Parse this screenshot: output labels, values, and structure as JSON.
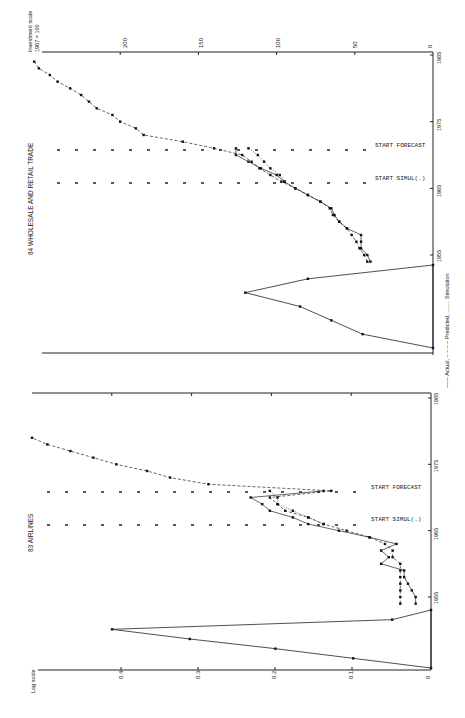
{
  "figure": {
    "orientation": "rotated 90 degrees counter-clockwise",
    "legend": "—— Actual, – – – – Predicted, ........ Simulation",
    "legend_items": [
      {
        "label": "Actual",
        "style": "solid"
      },
      {
        "label": "Predicted",
        "style": "dashed"
      },
      {
        "label": "Simulation",
        "style": "dotted"
      }
    ]
  },
  "panels": {
    "top": {
      "title": "84 WHOLESALE AND RETAIL TRADE",
      "yaxis_label_line1": "Investment scale",
      "yaxis_label_line2": "1967 = 100",
      "ytick_labels": [
        "200",
        "150",
        "100",
        "50",
        "0"
      ],
      "year_labels": [
        "1985",
        "1975",
        "1965",
        "1955"
      ],
      "marker_forecast": "START FORECAST",
      "marker_simul": "START SIMUL(.)"
    },
    "bottom": {
      "title": "83 AIRLINES",
      "lag_axis_label": "Lag scale",
      "lag_tick_labels": [
        "0.4",
        "0.3",
        "0.2",
        "0.1",
        "0"
      ],
      "year_labels": [
        "1985",
        "1975",
        "1965",
        "1955"
      ],
      "marker_forecast": "START FORECAST",
      "marker_simul": "START SIMUL(.)"
    }
  },
  "chart_data": [
    {
      "type": "line",
      "title": "84 WHOLESALE AND RETAIL TRADE",
      "xlabel": "Year",
      "ylabel": "Investment scale 1967 = 100",
      "xlim": [
        1953,
        1985
      ],
      "ylim": [
        0,
        250
      ],
      "x_ticks": [
        1955,
        1965,
        1975,
        1985
      ],
      "y_ticks": [
        0,
        50,
        100,
        150,
        200
      ],
      "annotations": [
        {
          "text": "START SIMUL(.)",
          "x": 1966
        },
        {
          "text": "START FORECAST",
          "x": 1971
        }
      ],
      "series": [
        {
          "name": "Actual",
          "style": "solid",
          "x": [
            1954,
            1955,
            1956,
            1957,
            1958,
            1959,
            1960,
            1961,
            1962,
            1963,
            1964,
            1965,
            1966,
            1967,
            1968,
            1969,
            1970,
            1971
          ],
          "values": [
            40,
            42,
            46,
            46,
            46,
            55,
            60,
            63,
            65,
            72,
            80,
            88,
            95,
            100,
            110,
            118,
            126,
            126
          ]
        },
        {
          "name": "Predicted",
          "style": "dashed",
          "x": [
            1954,
            1955,
            1956,
            1957,
            1958,
            1959,
            1960,
            1961,
            1962,
            1963,
            1964,
            1965,
            1966,
            1967,
            1968,
            1969,
            1970,
            1971,
            1972,
            1973,
            1974,
            1975,
            1976,
            1977,
            1978,
            1979,
            1980,
            1981,
            1982,
            1983,
            1984
          ],
          "values": [
            42,
            44,
            47,
            49,
            52,
            55,
            60,
            64,
            66,
            72,
            80,
            88,
            97,
            104,
            111,
            116,
            122,
            140,
            160,
            185,
            190,
            200,
            205,
            215,
            220,
            225,
            232,
            240,
            245,
            252,
            255
          ]
        },
        {
          "name": "Simulation",
          "style": "dotted",
          "x": [
            1966,
            1967,
            1968,
            1969,
            1970,
            1971
          ],
          "values": [
            95,
            98,
            104,
            108,
            112,
            118
          ]
        }
      ],
      "lag_distribution": {
        "lags": [
          0,
          1,
          2,
          3,
          4,
          5,
          6
        ],
        "weights": [
          0.0,
          0.16,
          0.24,
          0.17,
          0.13,
          0.09,
          0.0
        ]
      }
    },
    {
      "type": "line",
      "title": "83 AIRLINES",
      "xlabel": "Year",
      "ylabel": "Lag scale",
      "xlim": [
        1953,
        1985
      ],
      "ylim": [
        0,
        0.5
      ],
      "x_ticks": [
        1955,
        1965,
        1975,
        1985
      ],
      "y_ticks": [
        0,
        0.1,
        0.2,
        0.3,
        0.4
      ],
      "annotations": [
        {
          "text": "START SIMUL(.)",
          "x": 1966
        },
        {
          "text": "START FORECAST",
          "x": 1971
        }
      ],
      "series": [
        {
          "name": "Actual",
          "style": "solid",
          "x": [
            1954,
            1955,
            1956,
            1957,
            1958,
            1959,
            1960,
            1961,
            1962,
            1963,
            1964,
            1965,
            1966,
            1967,
            1968,
            1969,
            1970,
            1971
          ],
          "values": [
            0.02,
            0.02,
            0.025,
            0.03,
            0.035,
            0.035,
            0.065,
            0.055,
            0.065,
            0.045,
            0.08,
            0.12,
            0.16,
            0.18,
            0.21,
            0.22,
            0.235,
            0.14
          ]
        },
        {
          "name": "Predicted",
          "style": "dashed",
          "x": [
            1954,
            1955,
            1956,
            1957,
            1958,
            1959,
            1960,
            1961,
            1962,
            1963,
            1964,
            1965,
            1966,
            1967,
            1968,
            1969,
            1970,
            1971,
            1972,
            1973,
            1974,
            1975,
            1976,
            1977,
            1978,
            1979
          ],
          "values": [
            0.04,
            0.04,
            0.04,
            0.04,
            0.04,
            0.04,
            0.04,
            0.05,
            0.05,
            0.06,
            0.08,
            0.11,
            0.14,
            0.16,
            0.19,
            0.2,
            0.21,
            0.13,
            0.29,
            0.34,
            0.37,
            0.41,
            0.44,
            0.47,
            0.5,
            0.52
          ]
        },
        {
          "name": "Simulation",
          "style": "dotted",
          "x": [
            1966,
            1967,
            1968,
            1969,
            1970,
            1971
          ],
          "values": [
            0.14,
            0.16,
            0.18,
            0.2,
            0.2,
            0.21
          ]
        }
      ],
      "lag_distribution": {
        "lags": [
          0,
          1,
          2,
          3,
          4,
          5,
          6
        ],
        "weights": [
          0.0,
          0.05,
          0.41,
          0.31,
          0.2,
          0.1,
          0.0
        ]
      }
    }
  ]
}
